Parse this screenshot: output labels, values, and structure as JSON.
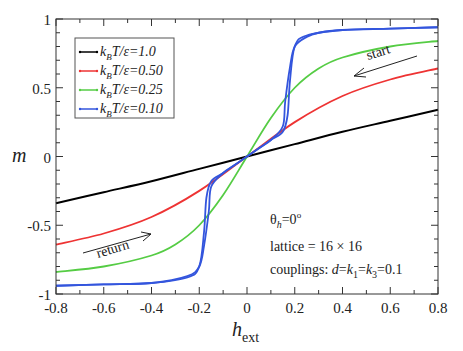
{
  "chart_data": {
    "type": "line",
    "title": "",
    "xlabel": "h_ext",
    "ylabel": "m",
    "xlim": [
      -0.8,
      0.8
    ],
    "ylim": [
      -1,
      1
    ],
    "grid": false,
    "legend_position": "upper-left",
    "x_ticks": [
      "-0.8",
      "-0.6",
      "-0.4",
      "-0.2",
      "0",
      "0.2",
      "0.4",
      "0.6",
      "0.8"
    ],
    "y_ticks": [
      "-1",
      "-0.5",
      "0",
      "0.5",
      "1"
    ],
    "series": [
      {
        "name": "k_B T/ε=1.0",
        "color": "#000000",
        "x": [
          -0.8,
          -0.6,
          -0.4,
          -0.2,
          0,
          0.2,
          0.4,
          0.6,
          0.8
        ],
        "values": [
          -0.34,
          -0.26,
          -0.18,
          -0.09,
          0.0,
          0.09,
          0.18,
          0.26,
          0.34
        ]
      },
      {
        "name": "k_B T/ε=0.50",
        "color": "#ee3333",
        "x": [
          -0.8,
          -0.6,
          -0.4,
          -0.2,
          0,
          0.2,
          0.4,
          0.6,
          0.8
        ],
        "values": [
          -0.64,
          -0.56,
          -0.44,
          -0.25,
          0.0,
          0.25,
          0.44,
          0.56,
          0.64
        ]
      },
      {
        "name": "k_B T/ε=0.25",
        "color": "#55cc44",
        "x": [
          -0.8,
          -0.6,
          -0.4,
          -0.3,
          -0.2,
          -0.1,
          0,
          0.1,
          0.2,
          0.3,
          0.4,
          0.6,
          0.8
        ],
        "values": [
          -0.84,
          -0.8,
          -0.72,
          -0.64,
          -0.5,
          -0.28,
          0.0,
          0.28,
          0.5,
          0.64,
          0.72,
          0.8,
          0.84
        ]
      },
      {
        "name": "k_B T/ε=0.10 (sweep down)",
        "color": "#3355dd",
        "x": [
          0.8,
          0.6,
          0.4,
          0.3,
          0.25,
          0.2,
          0.18,
          0.16,
          0.15,
          0.1,
          0.05,
          0,
          -0.05,
          -0.1,
          -0.15,
          -0.17,
          -0.18,
          -0.2,
          -0.25,
          -0.4,
          -0.6,
          -0.8
        ],
        "values": [
          0.94,
          0.93,
          0.92,
          0.9,
          0.87,
          0.8,
          0.65,
          0.4,
          0.22,
          0.12,
          0.06,
          0.0,
          -0.06,
          -0.12,
          -0.18,
          -0.3,
          -0.55,
          -0.8,
          -0.88,
          -0.92,
          -0.93,
          -0.94
        ]
      },
      {
        "name": "k_B T/ε=0.10 (sweep up)",
        "color": "#3355dd",
        "x": [
          -0.8,
          -0.6,
          -0.4,
          -0.25,
          -0.2,
          -0.18,
          -0.16,
          -0.15,
          -0.1,
          -0.05,
          0,
          0.05,
          0.1,
          0.15,
          0.17,
          0.18,
          0.2,
          0.25,
          0.4,
          0.6,
          0.8
        ],
        "values": [
          -0.94,
          -0.93,
          -0.92,
          -0.87,
          -0.8,
          -0.65,
          -0.4,
          -0.22,
          -0.12,
          -0.06,
          0.0,
          0.06,
          0.12,
          0.18,
          0.3,
          0.55,
          0.8,
          0.88,
          0.92,
          0.93,
          0.94
        ]
      }
    ],
    "annotations": [
      {
        "text": "start",
        "x": 0.6,
        "y": 0.58,
        "arrow_direction": "left"
      },
      {
        "text": "return",
        "x": -0.5,
        "y": -0.58,
        "arrow_direction": "right"
      },
      {
        "text": "θ_h=0°",
        "x": 0.2,
        "y": -0.4
      },
      {
        "text": "lattice = 16 × 16",
        "x": 0.2,
        "y": -0.58
      },
      {
        "text": "couplings: d=k_1=k_3=0.1",
        "x": 0.2,
        "y": -0.74
      }
    ]
  },
  "labels": {
    "ylabel": "m",
    "xlabel_main": "h",
    "xlabel_sub": "ext",
    "legend": [
      {
        "kb": "k",
        "b": "B",
        "rest": "T/ε=1.0"
      },
      {
        "kb": "k",
        "b": "B",
        "rest": "T/ε=0.50"
      },
      {
        "kb": "k",
        "b": "B",
        "rest": "T/ε=0.25"
      },
      {
        "kb": "k",
        "b": "B",
        "rest": "T/ε=0.10"
      }
    ],
    "start": "start",
    "return": "return",
    "theta_main": "θ",
    "theta_sub": "h",
    "theta_rest": "=0",
    "theta_sup": "o",
    "lattice": "lattice = 16 × 16",
    "couplings_prefix": "couplings: ",
    "couplings_d": "d",
    "couplings_eq1": "=",
    "couplings_k": "k",
    "couplings_k1_sub": "1",
    "couplings_eq2": "=",
    "couplings_k3": "k",
    "couplings_k3_sub": "3",
    "couplings_val": "=0.1"
  }
}
